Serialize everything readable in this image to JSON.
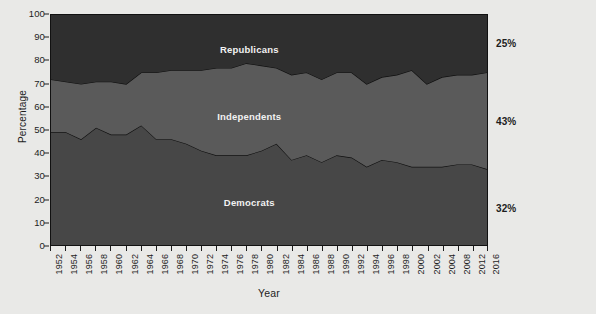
{
  "chart_data": {
    "type": "area",
    "title": "",
    "subtitle": "",
    "xlabel": "Year",
    "ylabel": "Percentage",
    "ylim": [
      0,
      100
    ],
    "yticks": [
      0,
      10,
      20,
      30,
      40,
      50,
      60,
      70,
      80,
      90,
      100
    ],
    "grid": false,
    "legend_position": "inline",
    "stacked": true,
    "stack_total": 100,
    "categories": [
      1952,
      1954,
      1956,
      1958,
      1960,
      1962,
      1964,
      1966,
      1968,
      1970,
      1972,
      1974,
      1976,
      1978,
      1980,
      1982,
      1984,
      1986,
      1988,
      1990,
      1992,
      1994,
      1996,
      1998,
      2000,
      2002,
      2004,
      2008,
      2012,
      2016
    ],
    "tick_labels": [
      "1952",
      "1954",
      "1956",
      "1958",
      "1960",
      "1962",
      "1964",
      "1966",
      "1968",
      "1970",
      "1972",
      "1974",
      "1976",
      "1978",
      "1980",
      "1982",
      "1984",
      "1986",
      "1988",
      "1990",
      "1992",
      "1994",
      "1996",
      "1998",
      "2000",
      "2002",
      "2004",
      "2008",
      "2012",
      "2016"
    ],
    "series": [
      {
        "name": "Democrats",
        "color": "#474747",
        "stack_order": 1,
        "values": [
          49,
          49,
          46,
          51,
          48,
          48,
          52,
          46,
          46,
          44,
          41,
          39,
          39,
          39,
          41,
          44,
          37,
          39,
          36,
          39,
          38,
          34,
          37,
          36,
          34,
          34,
          34,
          35,
          35,
          33
        ]
      },
      {
        "name": "Independents",
        "color": "#5a5a5a",
        "stack_order": 2,
        "values": [
          23,
          22,
          24,
          20,
          23,
          22,
          23,
          29,
          30,
          32,
          35,
          38,
          38,
          40,
          37,
          33,
          37,
          36,
          36,
          36,
          37,
          36,
          36,
          38,
          42,
          36,
          39,
          39,
          39,
          42
        ]
      },
      {
        "name": "Republicans",
        "color": "#2f2f2f",
        "stack_order": 3,
        "values": [
          28,
          29,
          30,
          29,
          29,
          30,
          25,
          25,
          24,
          24,
          24,
          23,
          23,
          21,
          22,
          23,
          26,
          25,
          28,
          25,
          25,
          30,
          27,
          26,
          24,
          30,
          27,
          26,
          26,
          25
        ]
      }
    ],
    "cumulative_boundaries": {
      "democrats_top": [
        49,
        49,
        46,
        51,
        48,
        48,
        52,
        46,
        46,
        44,
        41,
        39,
        39,
        39,
        41,
        44,
        37,
        39,
        36,
        39,
        38,
        34,
        37,
        36,
        34,
        34,
        34,
        35,
        35,
        33
      ],
      "independents_top": [
        72,
        71,
        70,
        71,
        71,
        70,
        75,
        75,
        76,
        76,
        76,
        77,
        77,
        79,
        78,
        77,
        74,
        75,
        72,
        75,
        75,
        70,
        73,
        74,
        76,
        70,
        73,
        74,
        74,
        75
      ]
    },
    "end_labels": [
      {
        "text": "25%",
        "value": 25,
        "series": "Republicans",
        "y_position": 87.5
      },
      {
        "text": "43%",
        "value": 43,
        "series": "Independents",
        "y_position": 54
      },
      {
        "text": "32%",
        "value": 32,
        "series": "Democrats",
        "y_position": 16.5
      }
    ],
    "inline_labels": [
      {
        "text": "Republicans",
        "x_position": 0.455,
        "y_position": 85
      },
      {
        "text": "Independents",
        "x_position": 0.455,
        "y_position": 56
      },
      {
        "text": "Democrats",
        "x_position": 0.455,
        "y_position": 19
      }
    ]
  }
}
